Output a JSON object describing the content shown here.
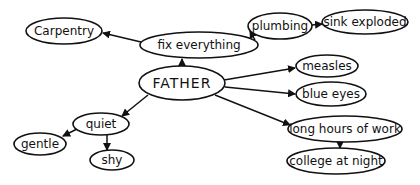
{
  "diagram": {
    "type": "concept-map",
    "colors": {
      "ink": "#111111",
      "background": "#ffffff"
    },
    "nodes": [
      {
        "id": "father",
        "label": "FATHER",
        "cx": 182,
        "cy": 83,
        "rx": 43,
        "ry": 17,
        "center": true
      },
      {
        "id": "fix",
        "label": "fix everything",
        "cx": 199,
        "cy": 45,
        "rx": 59,
        "ry": 13
      },
      {
        "id": "carpentry",
        "label": "Carpentry",
        "cx": 64,
        "cy": 31,
        "rx": 38,
        "ry": 13
      },
      {
        "id": "plumbing",
        "label": "plumbing",
        "cx": 280,
        "cy": 26,
        "rx": 32,
        "ry": 13
      },
      {
        "id": "sink",
        "label": "sink exploded",
        "cx": 365,
        "cy": 22,
        "rx": 43,
        "ry": 12
      },
      {
        "id": "measles",
        "label": "measles",
        "cx": 327,
        "cy": 66,
        "rx": 31,
        "ry": 11
      },
      {
        "id": "blueeyes",
        "label": "blue eyes",
        "cx": 331,
        "cy": 94,
        "rx": 35,
        "ry": 12
      },
      {
        "id": "longhours",
        "label": "long hours of work",
        "cx": 345,
        "cy": 129,
        "rx": 57,
        "ry": 13
      },
      {
        "id": "college",
        "label": "college at night",
        "cx": 336,
        "cy": 161,
        "rx": 49,
        "ry": 13
      },
      {
        "id": "quiet",
        "label": "quiet",
        "cx": 101,
        "cy": 124,
        "rx": 28,
        "ry": 11
      },
      {
        "id": "gentle",
        "label": "gentle",
        "cx": 40,
        "cy": 144,
        "rx": 26,
        "ry": 11
      },
      {
        "id": "shy",
        "label": "shy",
        "cx": 112,
        "cy": 160,
        "rx": 22,
        "ry": 10
      }
    ],
    "edges": [
      {
        "from": "father",
        "to": "fix",
        "x1": 182,
        "y1": 66,
        "x2": 182,
        "y2": 59
      },
      {
        "from": "fix",
        "to": "carpentry",
        "x1": 141,
        "y1": 42,
        "x2": 103,
        "y2": 33
      },
      {
        "from": "fix",
        "to": "plumbing",
        "x1": 255,
        "y1": 40,
        "x2": 250,
        "y2": 31
      },
      {
        "from": "plumbing",
        "to": "sink",
        "x1": 312,
        "y1": 25,
        "x2": 322,
        "y2": 24
      },
      {
        "from": "father",
        "to": "measles",
        "x1": 224,
        "y1": 80,
        "x2": 295,
        "y2": 68
      },
      {
        "from": "father",
        "to": "blueeyes",
        "x1": 225,
        "y1": 87,
        "x2": 295,
        "y2": 94
      },
      {
        "from": "father",
        "to": "longhours",
        "x1": 215,
        "y1": 95,
        "x2": 290,
        "y2": 125
      },
      {
        "from": "longhours",
        "to": "college",
        "x1": 340,
        "y1": 142,
        "x2": 340,
        "y2": 148
      },
      {
        "from": "father",
        "to": "quiet",
        "x1": 148,
        "y1": 95,
        "x2": 122,
        "y2": 116
      },
      {
        "from": "quiet",
        "to": "gentle",
        "x1": 77,
        "y1": 129,
        "x2": 63,
        "y2": 136
      },
      {
        "from": "quiet",
        "to": "shy",
        "x1": 107,
        "y1": 135,
        "x2": 107,
        "y2": 150
      }
    ]
  }
}
